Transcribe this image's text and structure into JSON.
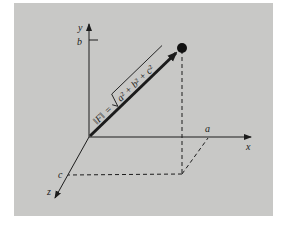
{
  "figure": {
    "axes": {
      "x": {
        "label": "x",
        "marker": "a"
      },
      "y": {
        "label": "y",
        "marker": "b"
      },
      "z": {
        "label": "z",
        "marker": "c"
      }
    },
    "vector": {
      "formula_lhs": "‖F‖",
      "formula_eq": "=",
      "formula_rhs": "a² + b² + c²",
      "formula_full": "‖F‖ = √(a² + b² + c²)"
    },
    "colors": {
      "panel": "#c8c8c6",
      "ink": "#1c1c1c",
      "background": "#ffffff"
    }
  }
}
